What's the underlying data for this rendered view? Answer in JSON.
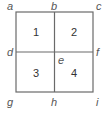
{
  "diagram": {
    "type": "grid-square",
    "colors": {
      "line": "#6a6a6a",
      "point_label": "#555555",
      "quadrant_label": "#333333",
      "background": "#ffffff"
    },
    "points": {
      "a": "a",
      "b": "b",
      "c": "c",
      "d": "d",
      "e": "e",
      "f": "f",
      "g": "g",
      "h": "h",
      "i": "i"
    },
    "quadrants": {
      "q1": "1",
      "q2": "2",
      "q3": "3",
      "q4": "4"
    }
  }
}
